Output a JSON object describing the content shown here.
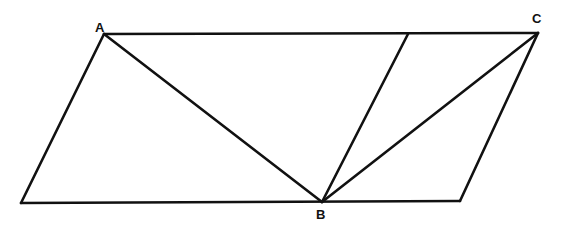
{
  "diagram": {
    "type": "geometry-figure",
    "stroke_color": "#111111",
    "background": "#ffffff",
    "points": {
      "A": {
        "x": 104,
        "y": 34
      },
      "C": {
        "x": 538,
        "y": 33
      },
      "B": {
        "x": 322,
        "y": 202
      },
      "BL": {
        "x": 21,
        "y": 203
      },
      "BR": {
        "x": 460,
        "y": 201
      },
      "T": {
        "x": 408,
        "y": 34
      }
    },
    "labels": [
      {
        "id": "A",
        "text": "A",
        "x": 95,
        "y": 32
      },
      {
        "id": "C",
        "text": "C",
        "x": 532,
        "y": 23
      },
      {
        "id": "B",
        "text": "B",
        "x": 316,
        "y": 219
      }
    ],
    "segments": [
      {
        "name": "top-side",
        "from": "A",
        "to": "C"
      },
      {
        "name": "bottom-side",
        "from": "BL",
        "to": "BR"
      },
      {
        "name": "left-side",
        "from": "BL",
        "to": "A"
      },
      {
        "name": "right-side",
        "from": "BR",
        "to": "C"
      },
      {
        "name": "segment-AB",
        "from": "A",
        "to": "B"
      },
      {
        "name": "segment-BT",
        "from": "B",
        "to": "T"
      },
      {
        "name": "segment-BC",
        "from": "B",
        "to": "C"
      }
    ]
  }
}
